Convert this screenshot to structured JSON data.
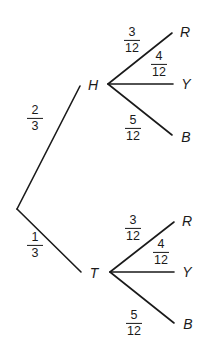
{
  "diagram": {
    "type": "probability-tree",
    "root": {
      "branches": [
        {
          "node": "H",
          "probability": {
            "num": "2",
            "den": "3"
          },
          "children": [
            {
              "node": "R",
              "probability": {
                "num": "3",
                "den": "12"
              }
            },
            {
              "node": "Y",
              "probability": {
                "num": "4",
                "den": "12"
              }
            },
            {
              "node": "B",
              "probability": {
                "num": "5",
                "den": "12"
              }
            }
          ]
        },
        {
          "node": "T",
          "probability": {
            "num": "1",
            "den": "3"
          },
          "children": [
            {
              "node": "R",
              "probability": {
                "num": "3",
                "den": "12"
              }
            },
            {
              "node": "Y",
              "probability": {
                "num": "4",
                "den": "12"
              }
            },
            {
              "node": "B",
              "probability": {
                "num": "5",
                "den": "12"
              }
            }
          ]
        }
      ]
    }
  },
  "colors": {
    "line": "#1a1a1a",
    "background": "#ffffff"
  }
}
